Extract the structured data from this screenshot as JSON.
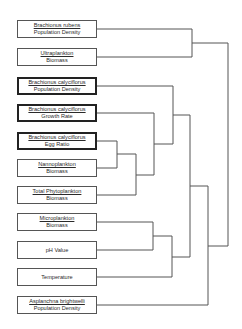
{
  "diagram": {
    "type": "dendrogram",
    "line_color": "#555555",
    "leaves": [
      {
        "id": "rubens_pd",
        "line1": "Brachionus rubens",
        "line2": "Population Density",
        "emphasized": false
      },
      {
        "id": "ultra_bio",
        "line1": "Ultraplankton",
        "line2": "Biomass",
        "emphasized": false
      },
      {
        "id": "caly_pd",
        "line1": "Brachionus calyciflorus",
        "line2": "Population Density",
        "emphasized": true
      },
      {
        "id": "caly_gr",
        "line1": "Brachionus calyciflorus",
        "line2": "Growth Rate",
        "emphasized": true
      },
      {
        "id": "caly_er",
        "line1": "Brachionus calyciflorus",
        "line2": "Egg Ratio",
        "emphasized": true
      },
      {
        "id": "nanno_bio",
        "line1": "Nannoplankton",
        "line2": "Biomass",
        "emphasized": false
      },
      {
        "id": "phyto_bio",
        "line1": "Total Phytoplankton",
        "line2": "Biomass",
        "emphasized": false
      },
      {
        "id": "micro_bio",
        "line1": "Microplankton",
        "line2": "Biomass",
        "emphasized": false
      },
      {
        "id": "ph",
        "line1": "",
        "line2": "pH Value",
        "emphasized": false
      },
      {
        "id": "temp",
        "line1": "",
        "line2": "Temperature",
        "emphasized": false
      },
      {
        "id": "asplanchna_pd",
        "line1": "Asplanchna brightwelli",
        "line2": "Population Density",
        "emphasized": false
      }
    ],
    "clusters": [
      {
        "members": [
          "rubens_pd",
          "ultra_bio"
        ]
      },
      {
        "members": [
          "caly_er",
          "nanno_bio"
        ]
      },
      {
        "members": [
          "caly_er",
          "nanno_bio",
          "phyto_bio"
        ]
      },
      {
        "members": [
          "caly_gr",
          "caly_er",
          "nanno_bio",
          "phyto_bio"
        ]
      },
      {
        "members": [
          "caly_pd",
          "caly_gr",
          "caly_er",
          "nanno_bio",
          "phyto_bio"
        ]
      },
      {
        "members": [
          "micro_bio",
          "ph"
        ]
      },
      {
        "members": [
          "micro_bio",
          "ph",
          "temp"
        ]
      },
      {
        "members": [
          "caly_pd",
          "caly_gr",
          "caly_er",
          "nanno_bio",
          "phyto_bio",
          "micro_bio",
          "ph",
          "temp"
        ]
      },
      {
        "members": [
          "caly_pd",
          "caly_gr",
          "caly_er",
          "nanno_bio",
          "phyto_bio",
          "micro_bio",
          "ph",
          "temp",
          "asplanchna_pd"
        ]
      },
      {
        "members": [
          "all"
        ]
      }
    ]
  }
}
